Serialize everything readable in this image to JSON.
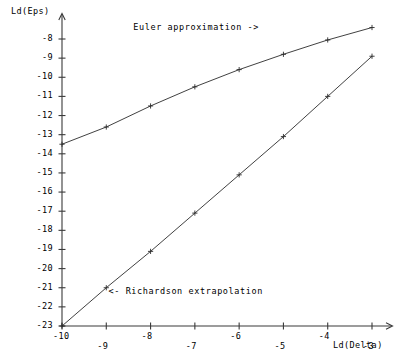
{
  "chart_data": {
    "type": "line",
    "title": "",
    "xlabel": "Ld(Delta)",
    "ylabel": "Ld(Eps)",
    "xlim": [
      -10.35,
      -2.6
    ],
    "ylim": [
      -23.8,
      -7.1
    ],
    "grid": false,
    "legend_position": "inline-annotations",
    "x_ticks": [
      -10,
      -9,
      -8,
      -7,
      -6,
      -5,
      -4,
      -3
    ],
    "x_tick_labels": [
      "-10",
      "-9",
      "-8",
      "-7",
      "-6",
      "-5",
      "-4",
      "-3"
    ],
    "y_ticks": [
      -8,
      -9,
      -10,
      -11,
      -12,
      -13,
      -14,
      -15,
      -16,
      -17,
      -18,
      -19,
      -20,
      -21,
      -22,
      -23
    ],
    "y_tick_labels": [
      "-8",
      "-9",
      "-10",
      "-11",
      "-12",
      "-13",
      "-14",
      "-15",
      "-16",
      "-17",
      "-18",
      "-19",
      "-20",
      "-21",
      "-22",
      "-23"
    ],
    "x": [
      -10,
      -9,
      -8,
      -7,
      -6,
      -5,
      -4,
      -3
    ],
    "series": [
      {
        "name": "Euler approximation",
        "marker": "+",
        "values": [
          -13.5,
          -12.6,
          -11.5,
          -10.5,
          -9.6,
          -8.8,
          -8.05,
          -7.4
        ]
      },
      {
        "name": "Richardson extrapolation",
        "marker": "+",
        "values": [
          -23.0,
          -21.0,
          -19.1,
          -17.1,
          -15.1,
          -13.1,
          -11.0,
          -8.9
        ]
      }
    ],
    "annotations": [
      {
        "id": "euler-annotation",
        "text": "Euler approximation ->",
        "x": -5.55,
        "y": -7.45,
        "anchor": "end"
      },
      {
        "id": "richardson-annotation",
        "text": "<- Richardson extrapolation",
        "x": -8.95,
        "y": -21.2,
        "anchor": "start"
      }
    ],
    "colors": {
      "background": "#ffffff",
      "axis": "#3a3a3a",
      "euler_line": "#2b2b2b",
      "richardson_line": "#2b2b2b",
      "text": "#1b1b1b"
    }
  }
}
